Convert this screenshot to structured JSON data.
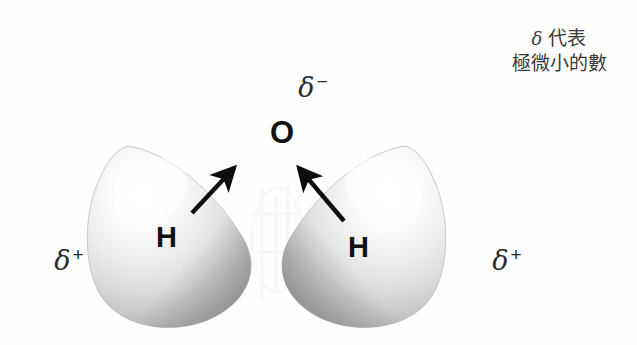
{
  "figure": {
    "background_color": "#fefefe",
    "width": 637,
    "height": 345
  },
  "charges": {
    "top_negative": "δ",
    "top_negative_sign": "−",
    "left_positive": "δ",
    "left_positive_sign": "+",
    "right_positive": "δ",
    "right_positive_sign": "+"
  },
  "atoms": {
    "oxygen_label": "O",
    "hydrogen_left_label": "H",
    "hydrogen_right_label": "H"
  },
  "legend": {
    "line1_symbol": "δ",
    "line1_text": " 代表",
    "line2_text": "極微小的數"
  },
  "colors": {
    "text": "#1c1c1c",
    "legend_text": "#3a3a3a",
    "lobe_light": "#fdfdfd",
    "lobe_mid": "#d8d8d8",
    "lobe_dark": "#9a9a9a",
    "arrow": "#0d0d0d"
  },
  "arrows": {
    "left_arrow_name": "dipole-arrow-left",
    "right_arrow_name": "dipole-arrow-right"
  }
}
